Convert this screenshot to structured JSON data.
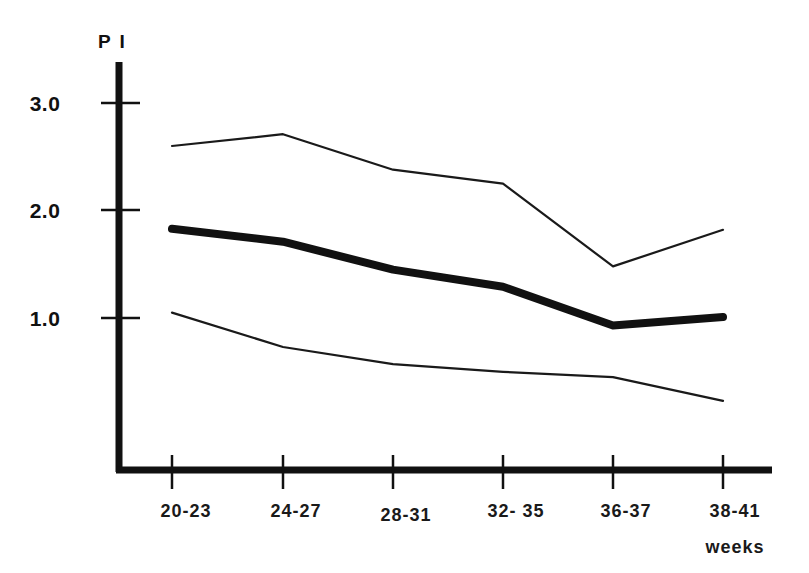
{
  "chart_data": {
    "type": "line",
    "title": "",
    "subtitle": "",
    "ylabel": "P I",
    "xlabel": "weeks",
    "categories": [
      "20-23",
      "24-27",
      "28-31",
      "32- 35",
      "36-37",
      "38-41"
    ],
    "yticks": [
      "1.0",
      "2.0",
      "3.0"
    ],
    "ytick_values": [
      1.0,
      2.0,
      3.0
    ],
    "ylim": [
      0.0,
      3.4
    ],
    "grid": false,
    "legend": "none",
    "series": [
      {
        "name": "upper",
        "style": "thin",
        "color": "#1a1a1a",
        "values": [
          2.6,
          2.71,
          2.38,
          2.25,
          1.48,
          1.82
        ]
      },
      {
        "name": "median",
        "style": "thick",
        "color": "#111111",
        "values": [
          1.83,
          1.71,
          1.45,
          1.29,
          0.93,
          1.01
        ]
      },
      {
        "name": "lower",
        "style": "thin",
        "color": "#1a1a1a",
        "values": [
          1.05,
          0.73,
          0.57,
          0.5,
          0.45,
          0.23
        ]
      }
    ]
  },
  "axes": {
    "y_axis_label": "P I",
    "x_axis_unit_label": "weeks"
  }
}
